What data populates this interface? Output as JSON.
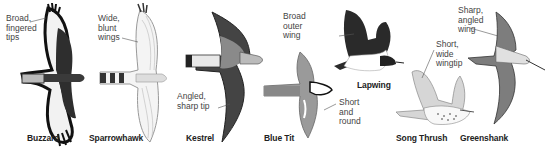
{
  "diagram": {
    "topic": "Bird wing shapes in flight",
    "birds": [
      {
        "name": "Buzzard",
        "annotation": "Broad,\nfingered\ntips"
      },
      {
        "name": "Sparrowhawk",
        "annotation": "Wide,\nblunt\nwings"
      },
      {
        "name": "Kestrel",
        "annotation": "Angled,\nsharp tip"
      },
      {
        "name": "Blue Tit",
        "annotation": "Short\nand\nround"
      },
      {
        "name": "Lapwing",
        "annotation": "Broad\nouter\nwing"
      },
      {
        "name": "Song Thrush",
        "annotation": "Short,\nwide\nwingtip"
      },
      {
        "name": "Greenshank",
        "annotation": "Sharp,\nangled\nwing"
      }
    ]
  },
  "colors": {
    "ink": "#1a1a1a",
    "dark_feather": "#2e2e2e",
    "mid_feather": "#7a7a7a",
    "light_feather": "#d9d9d9",
    "label_text": "#444444",
    "name_text": "#222222"
  }
}
